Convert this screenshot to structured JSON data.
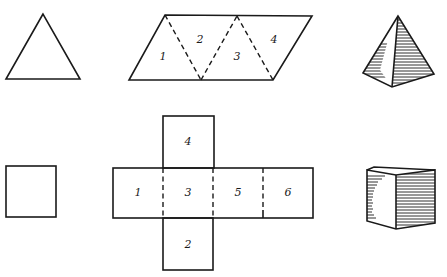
{
  "colors": {
    "ink": "#1a1a1a",
    "paper": "#ffffff"
  },
  "rows": [
    {
      "name": "tetrahedron",
      "flat_shape": "equilateral-triangle",
      "net": {
        "type": "tetrahedron-net-parallelogram",
        "faces": [
          {
            "label": "1",
            "x": 163,
            "y": 57
          },
          {
            "label": "2",
            "x": 200,
            "y": 40
          },
          {
            "label": "3",
            "x": 237,
            "y": 57
          },
          {
            "label": "4",
            "x": 274,
            "y": 40
          }
        ]
      },
      "solid": "triangular-pyramid"
    },
    {
      "name": "cube",
      "flat_shape": "square",
      "net": {
        "type": "cube-net-cross",
        "faces": [
          {
            "label": "4",
            "x": 188,
            "y": 142
          },
          {
            "label": "1",
            "x": 138,
            "y": 193
          },
          {
            "label": "3",
            "x": 188,
            "y": 193
          },
          {
            "label": "5",
            "x": 238,
            "y": 193
          },
          {
            "label": "6",
            "x": 288,
            "y": 193
          },
          {
            "label": "2",
            "x": 188,
            "y": 245
          }
        ]
      },
      "solid": "cube"
    }
  ]
}
